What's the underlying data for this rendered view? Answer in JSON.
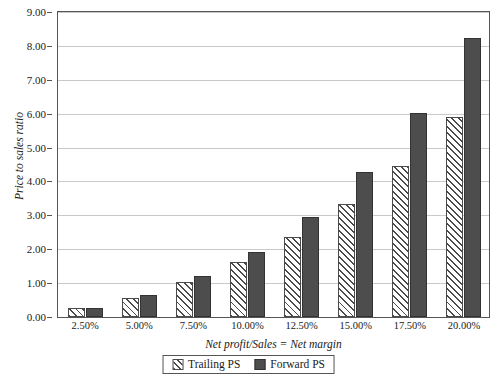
{
  "chart_data": {
    "type": "bar",
    "title": "",
    "xlabel": "Net profit/Sales = Net margin",
    "ylabel": "Price to sales ratio",
    "categories": [
      "2.50%",
      "5.00%",
      "7.50%",
      "10.00%",
      "12.50%",
      "15.00%",
      "17.50%",
      "20.00%"
    ],
    "series": [
      {
        "name": "Trailing PS",
        "color": "#ffffff",
        "pattern": "diagonal-hatch",
        "values": [
          0.27,
          0.57,
          1.04,
          1.63,
          2.36,
          3.33,
          4.45,
          5.9
        ]
      },
      {
        "name": "Forward PS",
        "color": "#4d4d4d",
        "pattern": "solid",
        "values": [
          0.27,
          0.64,
          1.2,
          1.93,
          2.95,
          4.28,
          6.02,
          8.22
        ]
      }
    ],
    "ylim": [
      0.0,
      9.0
    ],
    "ytick_step": 1.0,
    "yticks": [
      "0.00",
      "1.00",
      "2.00",
      "3.00",
      "4.00",
      "5.00",
      "6.00",
      "7.00",
      "8.00",
      "9.00"
    ],
    "grid": "horizontal",
    "legend_position": "bottom-center"
  },
  "legend": {
    "items": [
      {
        "label": "Trailing PS",
        "swatch": "hatched-swatch-icon"
      },
      {
        "label": "Forward PS",
        "swatch": "solid-swatch-icon"
      }
    ]
  }
}
